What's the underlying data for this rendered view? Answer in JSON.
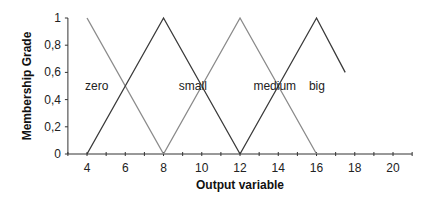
{
  "chart_data": {
    "type": "line",
    "title": "",
    "xlabel": "Output variable",
    "ylabel": "Membership Grade",
    "xlim": [
      3,
      21
    ],
    "ylim": [
      0,
      1
    ],
    "x_ticks": [
      4,
      6,
      8,
      10,
      12,
      14,
      16,
      18,
      20
    ],
    "x_tick_labels": [
      "4",
      "6",
      "8",
      "10",
      "12",
      "14",
      "16",
      "18",
      "20"
    ],
    "y_ticks": [
      0,
      0.2,
      0.4,
      0.6,
      0.8,
      1
    ],
    "y_tick_labels": [
      "0",
      "0,2",
      "0,4",
      "0,6",
      "0,8",
      "1"
    ],
    "grid": false,
    "legend": "inline labels",
    "series": [
      {
        "name": "zero",
        "color": "#8a8a8a",
        "points": [
          [
            4,
            1
          ],
          [
            8,
            0
          ]
        ]
      },
      {
        "name": "small",
        "color": "#3a3a3a",
        "points": [
          [
            4,
            0
          ],
          [
            8,
            1
          ],
          [
            12,
            0
          ]
        ]
      },
      {
        "name": "medium",
        "color": "#8a8a8a",
        "points": [
          [
            8,
            0
          ],
          [
            12,
            1
          ],
          [
            16,
            0
          ]
        ]
      },
      {
        "name": "big",
        "color": "#3a3a3a",
        "points": [
          [
            12,
            0
          ],
          [
            16,
            1
          ],
          [
            17.5,
            0.6
          ]
        ]
      }
    ],
    "annotations": [
      {
        "text": "zero",
        "x": 3.9,
        "y": 0.5
      },
      {
        "text": "small",
        "x": 8.8,
        "y": 0.5
      },
      {
        "text": "medium",
        "x": 12.7,
        "y": 0.5
      },
      {
        "text": "big",
        "x": 15.6,
        "y": 0.5
      }
    ]
  }
}
